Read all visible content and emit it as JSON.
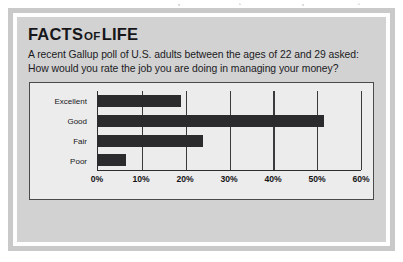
{
  "box": {
    "title_part1": "FACTS",
    "title_part2": "OF",
    "title_part3": "LIFE",
    "body_text": "A recent Gallup poll of U.S. adults between the ages of 22 and 29 asked: How would you rate the job you are doing in managing your money?"
  },
  "colors": {
    "frame_outer": "#c9c9c9",
    "frame_white": "#fefefe",
    "panel_bg": "#d2d2d2",
    "chart_bg": "#ececec",
    "bar": "#2b2b2e",
    "axis": "#2d2d30",
    "text": "#17171a"
  },
  "chart_data": {
    "type": "bar",
    "orientation": "horizontal",
    "title": "",
    "xlabel": "",
    "ylabel": "",
    "categories": [
      "Excellent",
      "Good",
      "Fair",
      "Poor"
    ],
    "values": [
      19,
      51.5,
      24,
      6.5
    ],
    "value_unit": "%",
    "xlim": [
      0,
      60
    ],
    "xticks": [
      0,
      10,
      20,
      30,
      40,
      50,
      60
    ],
    "xtick_labels": [
      "0%",
      "10%",
      "20%",
      "30%",
      "40%",
      "50%",
      "60%"
    ],
    "grid": "vertical",
    "legend": "none",
    "series": [
      {
        "name": "Self-rating of managing money",
        "values": [
          19,
          51.5,
          24,
          6.5
        ]
      }
    ]
  }
}
